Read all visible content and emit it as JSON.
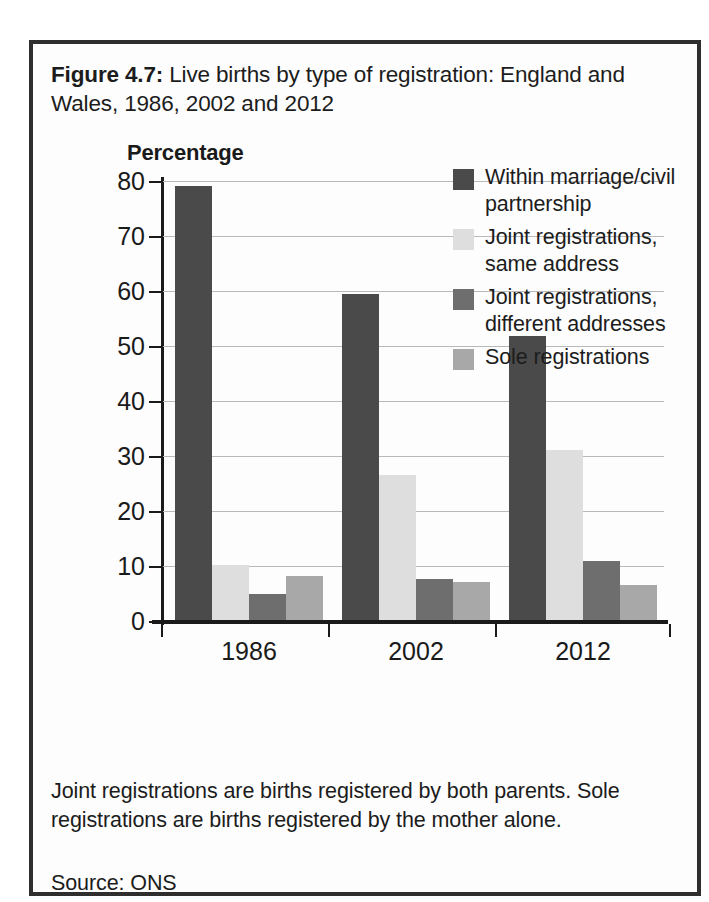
{
  "figure": {
    "label": "Figure 4.7:",
    "title_rest": " Live births by type of registration: England and Wales, 1986, 2002 and 2012",
    "note": "Joint registrations are births registered by both parents. Sole registrations are births registered by the mother alone.",
    "source": "Source: ONS"
  },
  "chart_data": {
    "type": "bar",
    "title": "Figure 4.7: Live births by type of registration: England and Wales, 1986, 2002 and 2012",
    "ylabel": "Percentage",
    "xlabel": "",
    "ylim": [
      0,
      80
    ],
    "yticks": [
      0,
      10,
      20,
      30,
      40,
      50,
      60,
      70,
      80
    ],
    "ytick_labels": [
      "0",
      "10",
      "20",
      "30",
      "40",
      "50",
      "60",
      "70",
      "80"
    ],
    "grid": true,
    "legend_position": "top-right",
    "categories": [
      "1986",
      "2002",
      "2012"
    ],
    "series": [
      {
        "name": "Within marriage/civil partnership",
        "color": "#4a4a4a",
        "values": [
          79.0,
          59.2,
          51.7
        ]
      },
      {
        "name": "Joint registrations, same address",
        "color": "#dedede",
        "values": [
          10.0,
          26.4,
          31.0
        ]
      },
      {
        "name": "Joint registrations, different addresses",
        "color": "#6e6e6e",
        "values": [
          4.7,
          7.5,
          10.7
        ]
      },
      {
        "name": "Sole registrations",
        "color": "#a8a8a8",
        "values": [
          8.0,
          6.9,
          6.3
        ]
      }
    ],
    "annotations": [
      "Joint registrations are births registered by both parents. Sole registrations are births registered by the mother alone.",
      "Source: ONS"
    ]
  }
}
